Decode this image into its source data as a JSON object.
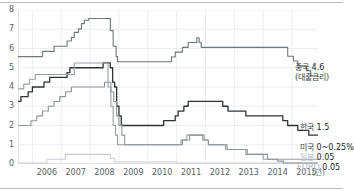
{
  "axes": {
    "y_ticks": [
      "8",
      "7",
      "6",
      "5",
      "4",
      "3",
      "2",
      "1",
      "0"
    ],
    "x_ticks": [
      "2006",
      "2007",
      "2008",
      "2009",
      "2010",
      "2011",
      "2012",
      "2013",
      "2014",
      "2015"
    ],
    "x_unit": "(년)"
  },
  "labels": {
    "china_name": "중국",
    "china_value": "4.6",
    "china_note": "(대출금리)",
    "korea_name": "한국",
    "korea_value": "1.5",
    "us_name": "미국",
    "us_value": "0~0.25%",
    "japan_name": "일본",
    "japan_value": "0.05",
    "euro_name": "EURO",
    "euro_value": "0.05"
  },
  "colors": {
    "china": "#6f767e",
    "korea": "#2f3338",
    "us": "#9aa0a7",
    "japan": "#c9cdd2",
    "euro": "#8e949b",
    "grid": "#e8eaec",
    "axis": "#c2c6ca",
    "text": "#59606b"
  },
  "chart_data": {
    "type": "line",
    "title": "",
    "xlabel": "(년)",
    "ylabel": "",
    "xlim": [
      2005.5,
      2015.9
    ],
    "ylim": [
      0,
      8
    ],
    "grid": true,
    "legend": "right",
    "series": [
      {
        "name": "중국 (대출금리)",
        "end_value": 4.6,
        "color": "#6f767e",
        "points": [
          [
            2005.5,
            5.58
          ],
          [
            2006.3,
            5.58
          ],
          [
            2006.35,
            5.85
          ],
          [
            2006.7,
            5.85
          ],
          [
            2006.75,
            6.12
          ],
          [
            2007.1,
            6.12
          ],
          [
            2007.2,
            6.39
          ],
          [
            2007.35,
            6.57
          ],
          [
            2007.45,
            6.84
          ],
          [
            2007.6,
            7.02
          ],
          [
            2007.7,
            7.29
          ],
          [
            2007.8,
            7.47
          ],
          [
            2007.95,
            7.56
          ],
          [
            2008.55,
            7.56
          ],
          [
            2008.7,
            6.93
          ],
          [
            2008.8,
            6.12
          ],
          [
            2008.9,
            5.58
          ],
          [
            2008.95,
            5.31
          ],
          [
            2009.0,
            5.31
          ],
          [
            2010.0,
            5.31
          ],
          [
            2010.15,
            5.31
          ],
          [
            2010.82,
            5.56
          ],
          [
            2010.95,
            5.81
          ],
          [
            2011.05,
            5.81
          ],
          [
            2011.2,
            6.06
          ],
          [
            2011.4,
            6.31
          ],
          [
            2011.55,
            6.31
          ],
          [
            2011.7,
            6.56
          ],
          [
            2011.78,
            6.31
          ],
          [
            2011.85,
            6.06
          ],
          [
            2012.0,
            6.06
          ],
          [
            2013.0,
            6.06
          ],
          [
            2014.0,
            6.06
          ],
          [
            2014.3,
            6.06
          ],
          [
            2014.85,
            5.6
          ],
          [
            2015.05,
            5.35
          ],
          [
            2015.2,
            5.1
          ],
          [
            2015.4,
            5.1
          ],
          [
            2015.5,
            4.85
          ],
          [
            2015.65,
            4.6
          ],
          [
            2015.9,
            4.6
          ]
        ]
      },
      {
        "name": "한국",
        "end_value": 1.5,
        "color": "#2f3338",
        "points": [
          [
            2005.5,
            3.25
          ],
          [
            2005.6,
            3.5
          ],
          [
            2005.85,
            3.75
          ],
          [
            2006.0,
            4.0
          ],
          [
            2006.2,
            4.0
          ],
          [
            2006.4,
            4.25
          ],
          [
            2006.6,
            4.5
          ],
          [
            2006.8,
            4.5
          ],
          [
            2007.0,
            4.5
          ],
          [
            2007.2,
            4.75
          ],
          [
            2007.3,
            5.0
          ],
          [
            2007.5,
            5.0
          ],
          [
            2007.75,
            5.0
          ],
          [
            2008.3,
            5.0
          ],
          [
            2008.45,
            5.25
          ],
          [
            2008.55,
            5.25
          ],
          [
            2008.7,
            5.0
          ],
          [
            2008.78,
            4.25
          ],
          [
            2008.85,
            4.0
          ],
          [
            2008.92,
            3.0
          ],
          [
            2009.0,
            2.5
          ],
          [
            2009.08,
            2.0
          ],
          [
            2009.15,
            2.0
          ],
          [
            2010.0,
            2.0
          ],
          [
            2010.45,
            2.0
          ],
          [
            2010.55,
            2.25
          ],
          [
            2010.75,
            2.25
          ],
          [
            2010.95,
            2.5
          ],
          [
            2011.05,
            2.75
          ],
          [
            2011.25,
            3.0
          ],
          [
            2011.4,
            3.25
          ],
          [
            2011.55,
            3.25
          ],
          [
            2012.0,
            3.25
          ],
          [
            2012.5,
            3.25
          ],
          [
            2012.6,
            3.0
          ],
          [
            2012.78,
            2.75
          ],
          [
            2013.0,
            2.75
          ],
          [
            2013.4,
            2.5
          ],
          [
            2013.6,
            2.5
          ],
          [
            2014.0,
            2.5
          ],
          [
            2014.55,
            2.5
          ],
          [
            2014.68,
            2.25
          ],
          [
            2014.85,
            2.0
          ],
          [
            2015.05,
            2.0
          ],
          [
            2015.2,
            1.75
          ],
          [
            2015.45,
            1.75
          ],
          [
            2015.58,
            1.5
          ],
          [
            2015.9,
            1.5
          ]
        ]
      },
      {
        "name": "미국",
        "end_value": 0.25,
        "color": "#9aa0a7",
        "points": [
          [
            2005.5,
            3.9
          ],
          [
            2005.7,
            4.15
          ],
          [
            2005.9,
            4.4
          ],
          [
            2006.1,
            4.65
          ],
          [
            2006.3,
            4.65
          ],
          [
            2006.6,
            4.65
          ],
          [
            2007.0,
            4.65
          ],
          [
            2007.3,
            4.65
          ],
          [
            2007.45,
            5.25
          ],
          [
            2007.6,
            5.25
          ],
          [
            2007.75,
            5.25
          ],
          [
            2007.95,
            5.25
          ],
          [
            2008.25,
            5.25
          ],
          [
            2008.4,
            5.25
          ],
          [
            2008.55,
            5.25
          ],
          [
            2008.62,
            4.0
          ],
          [
            2008.72,
            3.0
          ],
          [
            2008.8,
            2.0
          ],
          [
            2008.88,
            1.5
          ],
          [
            2008.95,
            1.0
          ],
          [
            2009.05,
            1.0
          ],
          [
            2010.0,
            1.0
          ],
          [
            2010.5,
            1.0
          ],
          [
            2011.0,
            1.0
          ],
          [
            2011.15,
            1.25
          ],
          [
            2011.35,
            1.5
          ],
          [
            2011.5,
            1.5
          ],
          [
            2011.75,
            1.5
          ],
          [
            2011.9,
            1.25
          ],
          [
            2012.1,
            1.0
          ],
          [
            2012.4,
            1.0
          ],
          [
            2012.7,
            0.75
          ],
          [
            2013.0,
            0.75
          ],
          [
            2013.4,
            0.5
          ],
          [
            2013.7,
            0.5
          ],
          [
            2014.0,
            0.25
          ],
          [
            2014.3,
            0.25
          ],
          [
            2015.0,
            0.25
          ],
          [
            2015.9,
            0.25
          ]
        ]
      },
      {
        "name": "일본",
        "end_value": 0.05,
        "color": "#c9cdd2",
        "points": [
          [
            2005.5,
            0.05
          ],
          [
            2006.0,
            0.05
          ],
          [
            2006.3,
            0.05
          ],
          [
            2006.5,
            0.25
          ],
          [
            2006.7,
            0.25
          ],
          [
            2006.9,
            0.25
          ],
          [
            2007.15,
            0.5
          ],
          [
            2007.4,
            0.5
          ],
          [
            2007.8,
            0.5
          ],
          [
            2008.3,
            0.5
          ],
          [
            2008.55,
            0.5
          ],
          [
            2008.7,
            0.3
          ],
          [
            2008.85,
            0.1
          ],
          [
            2009.0,
            0.1
          ],
          [
            2010.0,
            0.1
          ],
          [
            2011.0,
            0.05
          ],
          [
            2012.0,
            0.05
          ],
          [
            2013.0,
            0.05
          ],
          [
            2014.0,
            0.05
          ],
          [
            2015.9,
            0.05
          ]
        ]
      },
      {
        "name": "EURO",
        "end_value": 0.05,
        "color": "#8e949b",
        "points": [
          [
            2005.5,
            2.0
          ],
          [
            2005.8,
            2.0
          ],
          [
            2005.95,
            2.25
          ],
          [
            2006.15,
            2.5
          ],
          [
            2006.35,
            2.75
          ],
          [
            2006.55,
            3.0
          ],
          [
            2006.75,
            3.25
          ],
          [
            2006.95,
            3.5
          ],
          [
            2007.15,
            3.75
          ],
          [
            2007.35,
            4.0
          ],
          [
            2007.55,
            4.0
          ],
          [
            2008.0,
            4.0
          ],
          [
            2008.4,
            4.0
          ],
          [
            2008.5,
            4.25
          ],
          [
            2008.62,
            4.25
          ],
          [
            2008.72,
            3.75
          ],
          [
            2008.82,
            3.25
          ],
          [
            2008.92,
            2.5
          ],
          [
            2009.0,
            2.0
          ],
          [
            2009.1,
            1.5
          ],
          [
            2009.2,
            1.0
          ],
          [
            2009.35,
            1.0
          ],
          [
            2010.0,
            1.0
          ],
          [
            2011.0,
            1.0
          ],
          [
            2011.2,
            1.25
          ],
          [
            2011.45,
            1.5
          ],
          [
            2011.6,
            1.5
          ],
          [
            2011.8,
            1.5
          ],
          [
            2011.95,
            1.25
          ],
          [
            2012.1,
            1.0
          ],
          [
            2012.6,
            1.0
          ],
          [
            2012.75,
            0.75
          ],
          [
            2013.2,
            0.75
          ],
          [
            2013.45,
            0.5
          ],
          [
            2013.95,
            0.5
          ],
          [
            2014.15,
            0.25
          ],
          [
            2014.5,
            0.15
          ],
          [
            2014.7,
            0.05
          ],
          [
            2015.0,
            0.05
          ],
          [
            2015.9,
            0.05
          ]
        ]
      }
    ]
  }
}
